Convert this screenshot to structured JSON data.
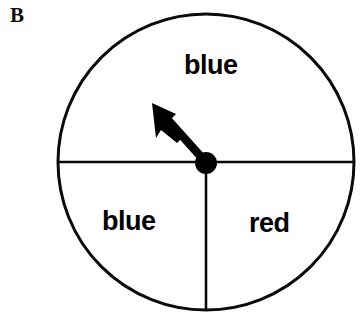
{
  "figure": {
    "panel_label": "B",
    "type": "probability-spinner-diagram",
    "background_color": "#ffffff",
    "stroke_color": "#000000",
    "width": 360,
    "height": 323
  },
  "spinner": {
    "center": {
      "x": 206,
      "y": 162
    },
    "radius": 148,
    "outline_width": 3,
    "hub": {
      "label": "center-pivot",
      "radius": 11,
      "fill": "#000000"
    },
    "dividers": [
      {
        "name": "horizontal-diameter",
        "from_angle_deg": 180,
        "to_angle_deg": 0
      },
      {
        "name": "vertical-lower-radius",
        "from_angle_deg": 270,
        "to_angle_deg": 270
      }
    ],
    "sectors": [
      {
        "name": "top-half",
        "label": "blue",
        "share_deg": 180,
        "start_deg": 0,
        "end_deg": 180
      },
      {
        "name": "bottom-left",
        "label": "blue",
        "share_deg": 90,
        "start_deg": 180,
        "end_deg": 270
      },
      {
        "name": "bottom-right",
        "label": "red",
        "share_deg": 90,
        "start_deg": 270,
        "end_deg": 360
      }
    ],
    "pointer": {
      "name": "spinner-arrow",
      "tip": {
        "x": 152,
        "y": 103
      },
      "tail": {
        "x": 206,
        "y": 162
      },
      "direction_deg": 132,
      "fill": "#000000"
    }
  },
  "labels": {
    "top": "blue",
    "bottom_left": "blue",
    "bottom_right": "red"
  }
}
